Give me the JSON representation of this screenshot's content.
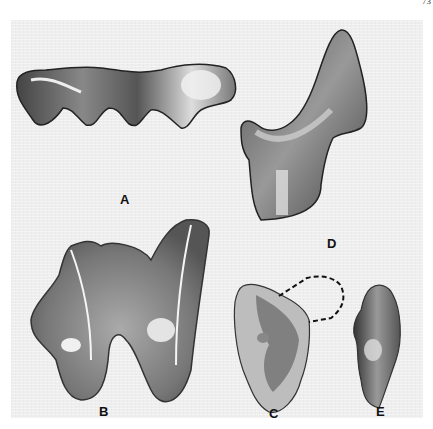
{
  "page": {
    "page_number_fragment": "73"
  },
  "plate": {
    "figures": [
      {
        "id": "A",
        "label": "A",
        "description": "tooth crown in lateral view, three cusps"
      },
      {
        "id": "B",
        "label": "B",
        "description": "two-rooted tooth in occlusal view"
      },
      {
        "id": "C",
        "label": "C",
        "description": "partial tooth with dashed reconstructed outline"
      },
      {
        "id": "D",
        "label": "D",
        "description": "tall tooth in lateral view with root"
      },
      {
        "id": "E",
        "label": "E",
        "description": "tooth in side view"
      }
    ]
  }
}
